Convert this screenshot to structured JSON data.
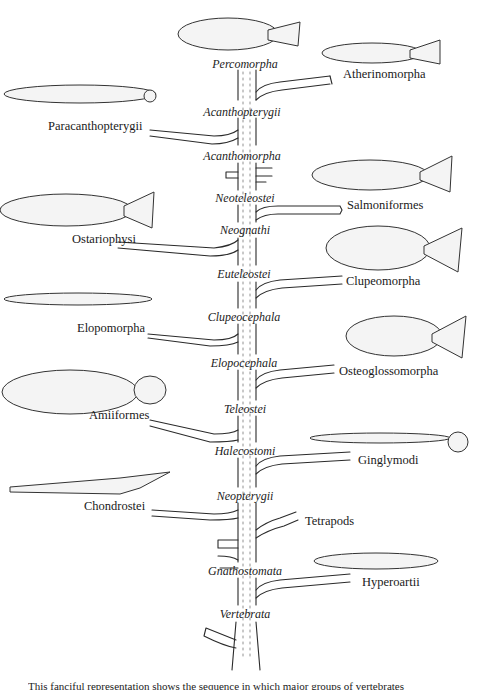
{
  "figure": {
    "type": "phylogenetic tree (fanciful tree of fish lineages)",
    "trunk_nodes": [
      {
        "label": "Percomorpha",
        "x": 245,
        "y": 65
      },
      {
        "label": "Acanthopterygii",
        "x": 242,
        "y": 113
      },
      {
        "label": "Acanthomorpha",
        "x": 242,
        "y": 157
      },
      {
        "label": "Neoteleostei",
        "x": 245,
        "y": 199
      },
      {
        "label": "Neognathi",
        "x": 245,
        "y": 231
      },
      {
        "label": "Euteleostei",
        "x": 244,
        "y": 275
      },
      {
        "label": "Clupeocephala",
        "x": 244,
        "y": 318
      },
      {
        "label": "Elopocephala",
        "x": 244,
        "y": 364
      },
      {
        "label": "Teleostei",
        "x": 245,
        "y": 410
      },
      {
        "label": "Halecostomi",
        "x": 245,
        "y": 452
      },
      {
        "label": "Neopterygii",
        "x": 245,
        "y": 497
      },
      {
        "label": "Gnathostomata",
        "x": 245,
        "y": 572
      },
      {
        "label": "Vertebrata",
        "x": 245,
        "y": 615
      }
    ],
    "left_taxa": [
      {
        "label": "Paracanthopterygii",
        "x": 48,
        "y": 127
      },
      {
        "label": "Ostariophysi",
        "x": 72,
        "y": 240
      },
      {
        "label": "Elopomorpha",
        "x": 77,
        "y": 329
      },
      {
        "label": "Amiiformes",
        "x": 89,
        "y": 416
      },
      {
        "label": "Chondrostei",
        "x": 84,
        "y": 507
      }
    ],
    "right_taxa": [
      {
        "label": "Atherinomorpha",
        "x": 343,
        "y": 75
      },
      {
        "label": "Salmoniformes",
        "x": 347,
        "y": 206
      },
      {
        "label": "Clupeomorpha",
        "x": 346,
        "y": 282
      },
      {
        "label": "Osteoglossomorpha",
        "x": 339,
        "y": 372
      },
      {
        "label": "Ginglymodi",
        "x": 358,
        "y": 461
      },
      {
        "label": "Tetrapods",
        "x": 305,
        "y": 522
      },
      {
        "label": "Hyperoartii",
        "x": 362,
        "y": 583
      }
    ]
  },
  "caption": "This fanciful representation shows the sequence in which major groups of vertebrates",
  "colors": {
    "ink": "#1a1a1a",
    "background": "#ffffff",
    "stipple": "#7a7a7a"
  }
}
